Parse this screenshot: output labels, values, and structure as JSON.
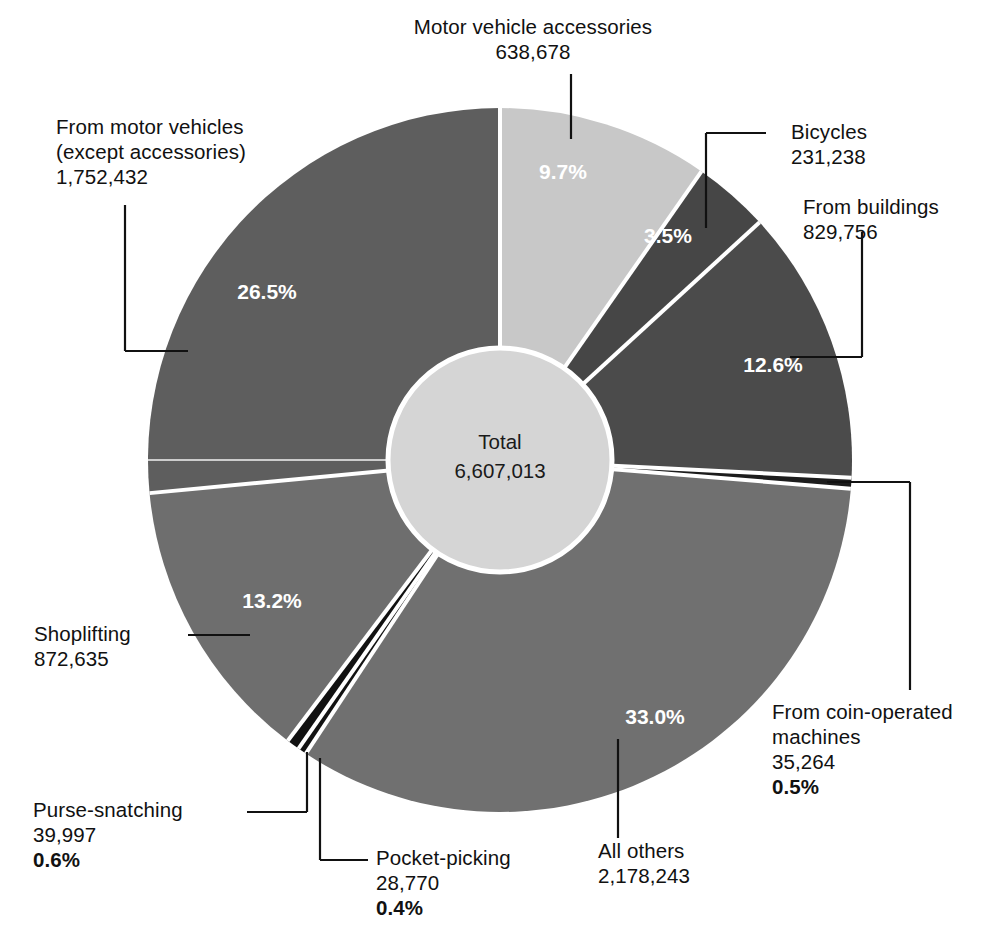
{
  "chart_data": {
    "type": "pie",
    "title": "",
    "subtitle": "",
    "xlabel": "",
    "ylabel": "",
    "center_label": "Total",
    "center_value": "6,607,013",
    "total": 6607013,
    "legend_position": "callouts",
    "grid": false,
    "categories": [
      "Motor vehicle accessories",
      "Bicycles",
      "From buildings",
      "From coin-operated machines",
      "All others",
      "Pocket-picking",
      "Purse-snatching",
      "Shoplifting",
      "From motor vehicles (except accessories)"
    ],
    "values": [
      638678,
      231238,
      829756,
      35264,
      2178243,
      28770,
      39997,
      872635,
      1752432
    ],
    "percentages": [
      9.7,
      3.5,
      12.6,
      0.5,
      33.0,
      0.4,
      0.6,
      13.2,
      26.5
    ],
    "colors": [
      "#c8c8c8",
      "#464646",
      "#4b4b4b",
      "#1c1c1c",
      "#707070",
      "#121212",
      "#111111",
      "#6e6e6e",
      "#5e5e5e"
    ],
    "slice_pct_labels": [
      "9.7%",
      "3.5%",
      "12.6%",
      "0.5%",
      "33.0%",
      "0.4%",
      "0.6%",
      "13.2%",
      "26.5%"
    ]
  },
  "slices": {
    "motor_vehicle_accessories": {
      "name": "Motor vehicle accessories",
      "value": "638,678",
      "pct": "9.7%",
      "color": "#c8c8c8"
    },
    "bicycles": {
      "name": "Bicycles",
      "value": "231,238",
      "pct": "3.5%",
      "color": "#464646"
    },
    "from_buildings": {
      "name": "From buildings",
      "value": "829,756",
      "pct": "12.6%",
      "color": "#4b4b4b"
    },
    "coin_operated": {
      "name_line1": "From coin-operated",
      "name_line2": "machines",
      "value": "35,264",
      "pct": "0.5%",
      "color": "#1c1c1c"
    },
    "all_others": {
      "name": "All others",
      "value": "2,178,243",
      "pct": "33.0%",
      "color": "#707070"
    },
    "pocket_picking": {
      "name": "Pocket-picking",
      "value": "28,770",
      "pct": "0.4%",
      "color": "#121212"
    },
    "purse_snatching": {
      "name": "Purse-snatching",
      "value": "39,997",
      "pct": "0.6%",
      "color": "#111111"
    },
    "shoplifting": {
      "name": "Shoplifting",
      "value": "872,635",
      "pct": "13.2%",
      "color": "#6e6e6e"
    },
    "from_motor_vehicles": {
      "name_line1": "From motor vehicles",
      "name_line2": "(except accessories)",
      "value": "1,752,432",
      "pct": "26.5%",
      "color": "#5e5e5e"
    }
  },
  "center": {
    "label": "Total",
    "value": "6,607,013"
  }
}
